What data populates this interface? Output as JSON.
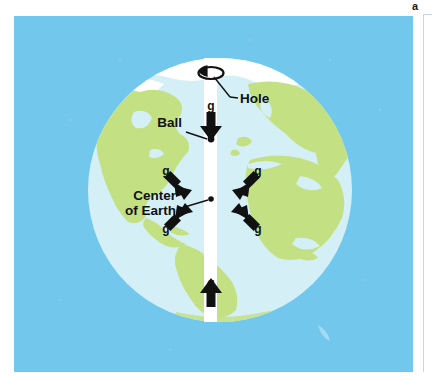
{
  "figure": {
    "panel_label": "a",
    "title_semantics": "ball-dropped-through-hole-in-earth-gravity-diagram",
    "labels": {
      "hole": "Hole",
      "ball": "Ball",
      "center_line1": "Center",
      "center_line2": "of Earth",
      "g_top": "g",
      "g_upper_left": "g",
      "g_upper_right": "g",
      "g_lower_left": "g",
      "g_lower_right": "g",
      "g_bottom": "g"
    },
    "colors": {
      "background_panel": "#72c8ec",
      "page": "#ffffff",
      "ocean": "#d5eff7",
      "land": "#c3e183",
      "ice": "#ffffff",
      "shaft": "#ffffff",
      "ink": "#111111",
      "rule": "#c9d6dd"
    },
    "geometry": {
      "panel": {
        "x": 14,
        "y": 16,
        "width": 399,
        "height": 356
      },
      "globe": {
        "cx": 220,
        "cy": 190,
        "r": 132
      },
      "shaft": {
        "x": 204,
        "width": 13,
        "top": 58,
        "bottom": 322
      },
      "hole_ellipse": {
        "cx": 211,
        "cy": 73,
        "rx": 12,
        "ry": 6
      },
      "ball": {
        "cx": 211,
        "cy": 139,
        "r": 3.2
      },
      "center_dot": {
        "cx": 211,
        "cy": 199,
        "r": 2.6
      }
    }
  }
}
